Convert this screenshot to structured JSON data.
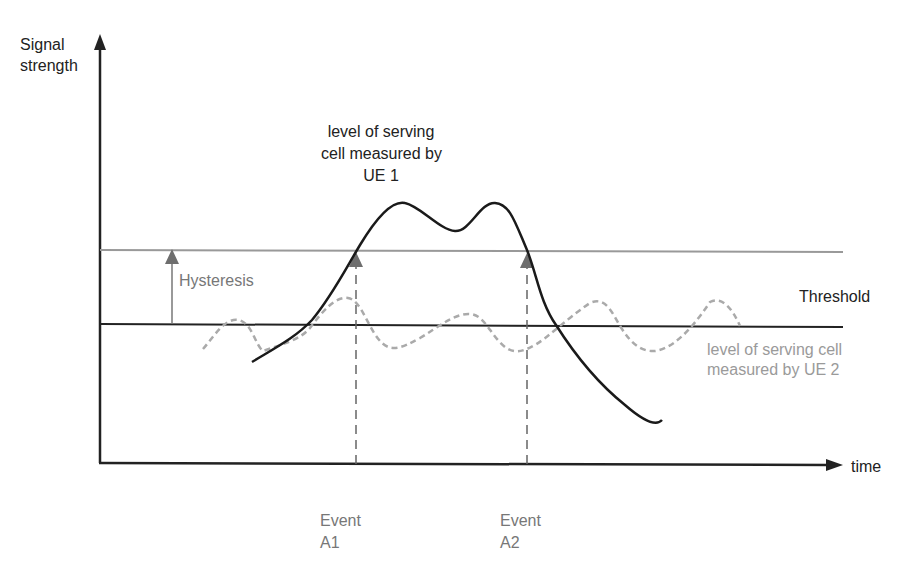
{
  "axes": {
    "y_label_line1": "Signal",
    "y_label_line2": "strength",
    "x_label": "time"
  },
  "labels": {
    "ue1_line1": "level of serving",
    "ue1_line2": "cell measured by",
    "ue1_line3": "UE 1",
    "hysteresis": "Hysteresis",
    "threshold": "Threshold",
    "ue2_line1": "level of serving cell",
    "ue2_line2": "measured by UE 2",
    "event_a1_line1": "Event",
    "event_a1_line2": "A1",
    "event_a2_line1": "Event",
    "event_a2_line2": "A2"
  },
  "colors": {
    "axis": "#222222",
    "threshold_line": "#222222",
    "hysteresis_line": "#9a9a9a",
    "ue1_curve": "#1a1a1a",
    "ue2_curve": "#aaaaaa",
    "event_marker": "#6e6e6e"
  }
}
